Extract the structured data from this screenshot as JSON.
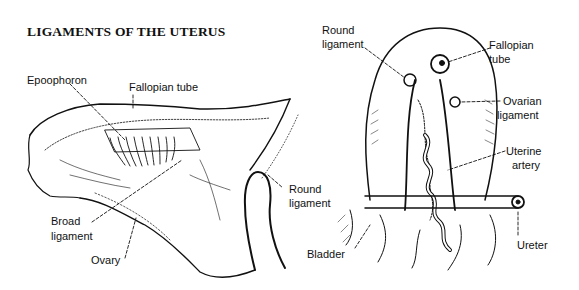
{
  "title": "LIGAMENTS OF THE UTERUS",
  "left_figure": {
    "name": "Broad ligament side view",
    "labels": {
      "epoophoron": "Epoophoron",
      "fallopian_tube": "Fallopian tube",
      "round_ligament_1": "Round",
      "round_ligament_2": "ligament",
      "broad_ligament_1": "Broad",
      "broad_ligament_2": "ligament",
      "ovary": "Ovary"
    }
  },
  "right_figure": {
    "name": "Uterus posterior view",
    "labels": {
      "round_ligament_1": "Round",
      "round_ligament_2": "ligament",
      "fallopian_tube_1": "Fallopian",
      "fallopian_tube_2": "tube",
      "ovarian_ligament_1": "Ovarian",
      "ovarian_ligament_2": "ligament",
      "uterine_artery_1": "Uterine",
      "uterine_artery_2": "artery",
      "bladder": "Bladder",
      "ureter": "Ureter"
    }
  },
  "colors": {
    "ink": "#111111",
    "background": "#ffffff"
  }
}
